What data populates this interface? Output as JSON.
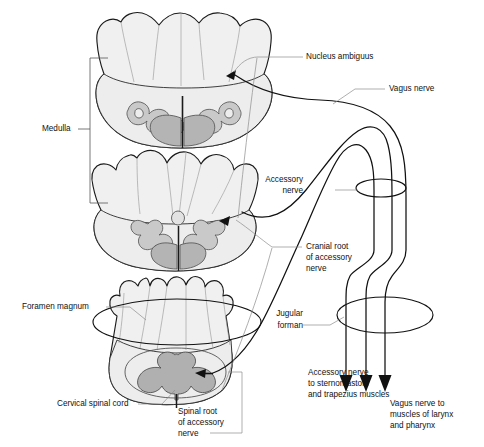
{
  "figure": {
    "background_color": "#ffffff",
    "line_color": "#111111",
    "leader_color": "#8d8d8d",
    "fill_light": "#f0f0f0",
    "fill_gray": "#b4b4b4",
    "fill_olive": "#c9c9c9"
  },
  "labels": {
    "medulla": "Medulla",
    "nucleus_ambiguus": "Nucleus ambiguus",
    "vagus_nerve": "Vagus nerve",
    "accessory_nerve_line1": "Accessory",
    "accessory_nerve_line2": "nerve",
    "cranial_root_line1": "Cranial root",
    "cranial_root_line2": "of accessory",
    "cranial_root_line3": "nerve",
    "foramen_magnum": "Foramen magnum",
    "jugular_foramen_line1": "Jugular",
    "jugular_foramen_line2": "forman",
    "cervical_spinal_cord": "Cervical spinal cord",
    "spinal_root_line1": "Spinal root",
    "spinal_root_line2": "of accessory",
    "spinal_root_line3": "nerve",
    "accessory_target_line1": "Accessory nerve",
    "accessory_target_line2": "to sternomastoid",
    "accessory_target_line3": "and trapezius muscles",
    "vagus_target_line1": "Vagus nerve to",
    "vagus_target_line2": "muscles of larynx",
    "vagus_target_line3": "and pharynx"
  },
  "sections": {
    "upper_medulla": "upper-medulla-cross-section",
    "lower_medulla": "lower-medulla-cross-section",
    "cervical_cord": "cervical-spinal-cord-cross-section"
  }
}
